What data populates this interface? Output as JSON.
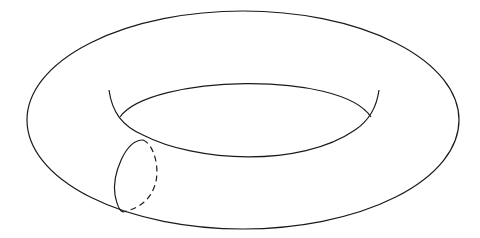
{
  "figure": {
    "title": "Torus",
    "colors": {
      "background": "#ffffff",
      "stroke": "#1a1a1a"
    },
    "elements": [
      {
        "id": "outer-ellipse",
        "label": "Outer boundary of torus"
      },
      {
        "id": "inner-hole-lower",
        "label": "Inner hole rim (front edge)"
      },
      {
        "id": "inner-hole-upper",
        "label": "Inner hole rim (back silhouette)"
      },
      {
        "id": "cross-section-front",
        "label": "Meridian cross-section (visible, solid)"
      },
      {
        "id": "cross-section-back",
        "label": "Meridian cross-section (hidden, dashed)"
      }
    ]
  }
}
